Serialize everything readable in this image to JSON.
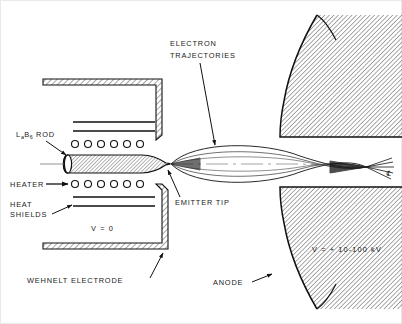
{
  "figure": {
    "background_color": "#ffffff",
    "line_color": "#111111",
    "hatch_color": "#333333"
  },
  "labels": {
    "lab6_rod": {
      "prefix": "La",
      "sub1": "6",
      "base": "B",
      "sub2": "6",
      "text": "La",
      "suffix": "ROD",
      "full": "LaB6 ROD"
    },
    "lab6_line1": "L",
    "lab6_a": "a",
    "lab6_b": "B",
    "lab6_6": "6",
    "lab6_rod_word": "ROD",
    "heater": "HEATER",
    "heat_shields_line1": "HEAT",
    "heat_shields_line2": "SHIELDS",
    "wehnelt_voltage": "V = 0",
    "wehnelt_electrode": "WEHNELT ELECTRODE",
    "emitter_tip": "EMITTER TIP",
    "electron_traj_line1": "ELECTRON",
    "electron_traj_line2": "TRAJECTORIES",
    "anode": "ANODE",
    "anode_voltage": "V = + 10-100 kV",
    "centerline_symbol": "℄"
  },
  "components": {
    "wehnelt": {
      "name": "Wehnelt electrode",
      "voltage": "V = 0"
    },
    "anode": {
      "name": "Anode",
      "voltage": "V = + 10-100 kV"
    },
    "cathode": {
      "name": "LaB6 rod",
      "feature": "Emitter tip"
    },
    "heater": {
      "name": "Heater",
      "coil_count_top": 6,
      "coil_count_bottom": 6
    },
    "heat_shields": {
      "name": "Heat shields",
      "count_top": 2,
      "count_bottom": 2
    },
    "trajectories": {
      "name": "Electron trajectories",
      "ray_count": 7,
      "crossover": true
    }
  }
}
